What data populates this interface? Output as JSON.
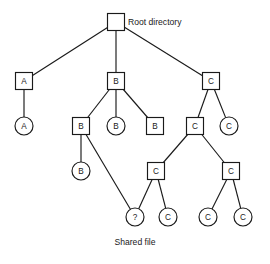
{
  "diagram": {
    "caption_root": "Root directory",
    "caption_shared": "Shared file",
    "colors": {
      "stroke": "#1a1a1a",
      "fill": "#ffffff",
      "background": "#ffffff"
    },
    "nodes": [
      {
        "id": "root",
        "label": "",
        "shape": "square",
        "cx": 116,
        "cy": 22
      },
      {
        "id": "a-dir",
        "label": "A",
        "shape": "square",
        "cx": 24,
        "cy": 81
      },
      {
        "id": "b-dir",
        "label": "B",
        "shape": "square",
        "cx": 116,
        "cy": 81
      },
      {
        "id": "c-dir",
        "label": "C",
        "shape": "square",
        "cx": 211,
        "cy": 81
      },
      {
        "id": "a-file",
        "label": "A",
        "shape": "circle",
        "cx": 24,
        "cy": 126
      },
      {
        "id": "b-dir2",
        "label": "B",
        "shape": "square",
        "cx": 81,
        "cy": 126
      },
      {
        "id": "b-file1",
        "label": "B",
        "shape": "circle",
        "cx": 116,
        "cy": 126
      },
      {
        "id": "b-file2",
        "label": "B",
        "shape": "square",
        "cx": 155,
        "cy": 126
      },
      {
        "id": "c-dir2",
        "label": "C",
        "shape": "square",
        "cx": 195,
        "cy": 126
      },
      {
        "id": "c-file1",
        "label": "C",
        "shape": "circle",
        "cx": 229,
        "cy": 126
      },
      {
        "id": "b-file3",
        "label": "B",
        "shape": "circle",
        "cx": 81,
        "cy": 171
      },
      {
        "id": "c-dir3",
        "label": "C",
        "shape": "square",
        "cx": 156,
        "cy": 171
      },
      {
        "id": "c-dir4",
        "label": "C",
        "shape": "square",
        "cx": 231,
        "cy": 171
      },
      {
        "id": "shared",
        "label": "?",
        "shape": "circle",
        "cx": 135,
        "cy": 217
      },
      {
        "id": "c-file2",
        "label": "C",
        "shape": "circle",
        "cx": 168,
        "cy": 217
      },
      {
        "id": "c-file3",
        "label": "C",
        "shape": "circle",
        "cx": 208,
        "cy": 217
      },
      {
        "id": "c-file4",
        "label": "C",
        "shape": "circle",
        "cx": 243,
        "cy": 217
      }
    ],
    "edges": [
      {
        "from": "root",
        "to": "a-dir"
      },
      {
        "from": "root",
        "to": "b-dir"
      },
      {
        "from": "root",
        "to": "c-dir"
      },
      {
        "from": "a-dir",
        "to": "a-file"
      },
      {
        "from": "b-dir",
        "to": "b-dir2"
      },
      {
        "from": "b-dir",
        "to": "b-file1"
      },
      {
        "from": "b-dir",
        "to": "b-file2"
      },
      {
        "from": "c-dir",
        "to": "c-dir2"
      },
      {
        "from": "c-dir",
        "to": "c-file1"
      },
      {
        "from": "b-dir2",
        "to": "b-file3"
      },
      {
        "from": "b-dir2",
        "to": "shared"
      },
      {
        "from": "c-dir2",
        "to": "c-dir3"
      },
      {
        "from": "c-dir2",
        "to": "c-dir4"
      },
      {
        "from": "c-dir3",
        "to": "shared"
      },
      {
        "from": "c-dir3",
        "to": "c-file2"
      },
      {
        "from": "c-dir4",
        "to": "c-file3"
      },
      {
        "from": "c-dir4",
        "to": "c-file4"
      }
    ],
    "geometry": {
      "square_size": 17,
      "circle_radius": 9,
      "root_caption_x": 128,
      "root_caption_y": 22,
      "shared_caption_x": 135,
      "shared_caption_y": 245
    }
  }
}
